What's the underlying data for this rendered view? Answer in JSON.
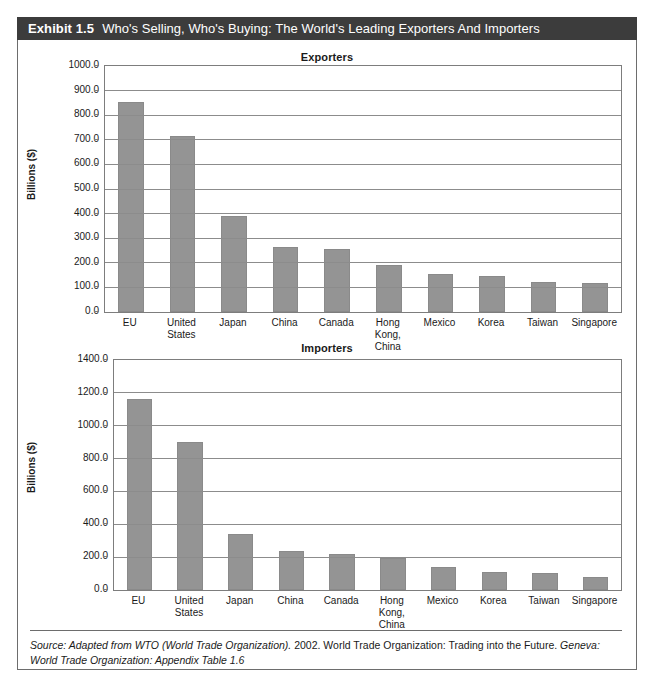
{
  "exhibit": {
    "number": "Exhibit 1.5",
    "title": "Who's Selling, Who's Buying: The World's Leading Exporters And Importers"
  },
  "source": {
    "part1": "Source: Adapted from WTO (World Trade Organization).",
    "part2": " 2002.",
    "part3": " World Trade Organization: Trading into the Future.",
    "part4": " Geneva: World Trade Organization: Appendix Table 1.6"
  },
  "colors": {
    "bar": "#949494",
    "title_bar": "#3c3c3c",
    "grid": "#8c8c8c",
    "frame": "#6d6d6d"
  },
  "chart_data": [
    {
      "type": "bar",
      "title": "Exporters",
      "xlabel": "",
      "ylabel": "Billions ($)",
      "ylim": [
        0,
        1000
      ],
      "grid": true,
      "legend": "none",
      "categories": [
        "EU",
        "United States",
        "Japan",
        "China",
        "Canada",
        "Hong Kong, China",
        "Mexico",
        "Korea",
        "Taiwan",
        "Singapore"
      ],
      "values": [
        855,
        715,
        390,
        265,
        255,
        190,
        155,
        145,
        120,
        118
      ],
      "yticks": [
        "0.0",
        "100.0",
        "200.0",
        "300.0",
        "400.0",
        "500.0",
        "600.0",
        "700.0",
        "800.0",
        "900.0",
        "1000.0"
      ],
      "ytick_values": [
        0,
        100,
        200,
        300,
        400,
        500,
        600,
        700,
        800,
        900,
        1000
      ]
    },
    {
      "type": "bar",
      "title": "Importers",
      "xlabel": "",
      "ylabel": "Billions ($)",
      "ylim": [
        0,
        1400
      ],
      "grid": true,
      "legend": "none",
      "categories": [
        "EU",
        "United States",
        "Japan",
        "China",
        "Canada",
        "Hong Kong, China",
        "Mexico",
        "Korea",
        "Taiwan",
        "Singapore"
      ],
      "values": [
        1165,
        900,
        340,
        235,
        220,
        195,
        140,
        110,
        105,
        80
      ],
      "yticks": [
        "0.0",
        "200.0",
        "400.0",
        "600.0",
        "800.0",
        "1000.0",
        "1200.0",
        "1400.0"
      ],
      "ytick_values": [
        0,
        200,
        400,
        600,
        800,
        1000,
        1200,
        1400
      ]
    }
  ]
}
